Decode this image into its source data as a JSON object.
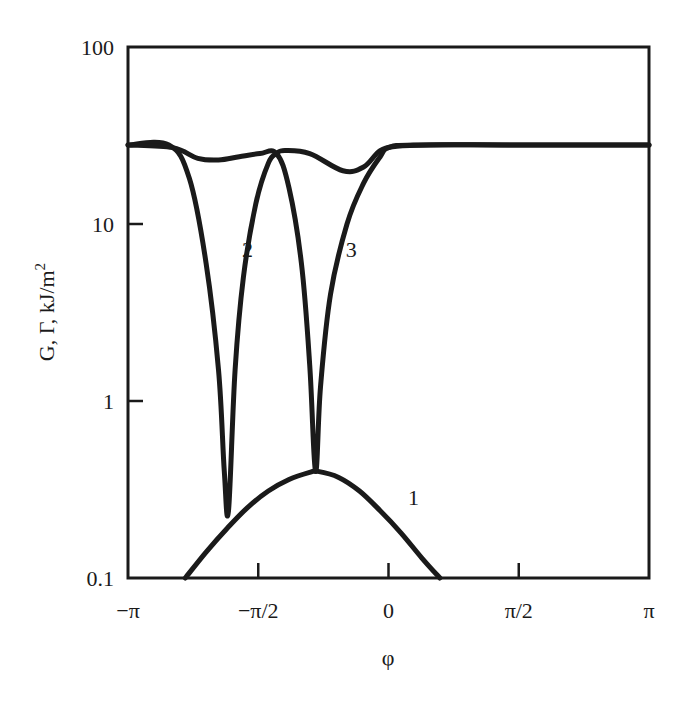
{
  "chart_data": {
    "type": "line",
    "title": "",
    "xlabel": "φ",
    "ylabel": "G, Γ, kJ/m²",
    "ylabel_parts": {
      "main": "G, Γ, kJ/m",
      "sup": "2"
    },
    "yscale": "log",
    "xlim": [
      -3.1416,
      3.1416
    ],
    "ylim": [
      0.1,
      100
    ],
    "grid": false,
    "legend": "none (curves labelled inline)",
    "x_ticks": [
      {
        "value": -3.1416,
        "label": "−π"
      },
      {
        "value": -1.5708,
        "label": "−π/2"
      },
      {
        "value": 0,
        "label": "0"
      },
      {
        "value": 1.5708,
        "label": "π/2"
      },
      {
        "value": 3.1416,
        "label": "π"
      }
    ],
    "y_ticks": [
      {
        "value": 100,
        "label": "100"
      },
      {
        "value": 10,
        "label": "10"
      },
      {
        "value": 1,
        "label": "1"
      },
      {
        "value": 0.1,
        "label": "0.1"
      }
    ],
    "series": [
      {
        "name": "1",
        "description": "lower dome curve",
        "x": [
          -2.45,
          -2.2,
          -1.95,
          -1.7,
          -1.45,
          -1.2,
          -0.95,
          -0.85,
          -0.6,
          -0.35,
          -0.1,
          0.15,
          0.4,
          0.62
        ],
        "y": [
          0.1,
          0.14,
          0.19,
          0.25,
          0.31,
          0.36,
          0.395,
          0.4,
          0.37,
          0.31,
          0.24,
          0.18,
          0.13,
          0.1
        ]
      },
      {
        "name": "2",
        "description": "deep dip near φ ≈ −1.95",
        "x": [
          -3.1416,
          -2.65,
          -2.4,
          -2.2,
          -2.05,
          -1.98,
          -1.93,
          -1.85,
          -1.75,
          -1.6,
          -1.45,
          -1.35,
          -1.25,
          -0.95,
          -0.55,
          -0.3,
          -0.1,
          0.1,
          0.5,
          1.5,
          3.1416
        ],
        "y": [
          28,
          28,
          18,
          6,
          1.5,
          0.4,
          0.24,
          1.5,
          5,
          13,
          22,
          25,
          26,
          25,
          20,
          21,
          26,
          27.5,
          28,
          28,
          28
        ]
      },
      {
        "name": "3",
        "description": "deep dip near φ ≈ −0.85",
        "x": [
          -3.1416,
          -2.6,
          -2.3,
          -2.05,
          -1.8,
          -1.55,
          -1.35,
          -1.2,
          -1.05,
          -0.95,
          -0.88,
          -0.82,
          -0.7,
          -0.5,
          -0.3,
          -0.1,
          0.0,
          0.3,
          1.5,
          3.1416
        ],
        "y": [
          28,
          27,
          23.5,
          23,
          24,
          25,
          25,
          16,
          6,
          1.6,
          0.4,
          1.2,
          4,
          10,
          17,
          24,
          27,
          28,
          28,
          28
        ]
      }
    ],
    "annotations": [
      {
        "text": "1",
        "x": 0.3,
        "y": 0.26
      },
      {
        "text": "2",
        "x": -1.7,
        "y": 6.5
      },
      {
        "text": "3",
        "x": -0.45,
        "y": 6.5
      }
    ],
    "plot_area_px": {
      "left": 128,
      "right": 649,
      "top": 47,
      "bottom": 578
    }
  }
}
